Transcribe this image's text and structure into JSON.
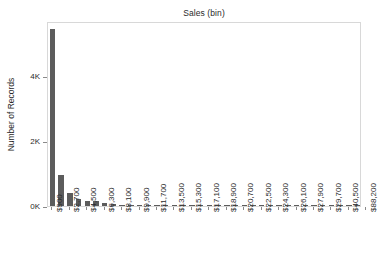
{
  "chart_data": {
    "type": "bar",
    "title": "Sales (bin)",
    "xlabel": "",
    "ylabel": "Number of Records",
    "grid": false,
    "legend": null,
    "ylim": [
      0,
      5700
    ],
    "ytick_labels": [
      "0K",
      "2K",
      "4K"
    ],
    "ytick_values": [
      0,
      2000,
      4000
    ],
    "bin_width": 900,
    "xtick_labels": [
      "$900",
      "$2,700",
      "$4,500",
      "$6,300",
      "$8,100",
      "$9,900",
      "$11,700",
      "$13,500",
      "$15,300",
      "$17,100",
      "$18,900",
      "$20,700",
      "$22,500",
      "$24,300",
      "$26,100",
      "$27,900",
      "$29,700",
      "$40,500",
      "$88,200"
    ],
    "categories": [
      "$900",
      "$1,800",
      "$2,700",
      "$3,600",
      "$4,500",
      "$5,400",
      "$6,300",
      "$7,200",
      "$8,100",
      "$9,000",
      "$9,900",
      "$10,800",
      "$11,700",
      "$12,600",
      "$13,500",
      "$14,400",
      "$15,300",
      "$16,200",
      "$17,100",
      "$18,000",
      "$18,900",
      "$19,800",
      "$20,700",
      "$21,600",
      "$22,500",
      "$23,400",
      "$24,300",
      "$25,200",
      "$26,100",
      "$27,000",
      "$27,900",
      "$28,800",
      "$29,700",
      "$30,600",
      "$40,500",
      "$88,200"
    ],
    "values": [
      5440,
      950,
      400,
      215,
      150,
      140,
      95,
      60,
      42,
      35,
      30,
      26,
      22,
      18,
      16,
      13,
      11,
      10,
      9,
      8,
      7,
      6,
      6,
      5,
      5,
      4,
      4,
      3,
      3,
      3,
      2,
      2,
      2,
      2,
      2,
      1
    ],
    "bar_color": "#5c5c5c",
    "frame_color": "#d8d8d8",
    "text_color": "#2a2a2a"
  }
}
